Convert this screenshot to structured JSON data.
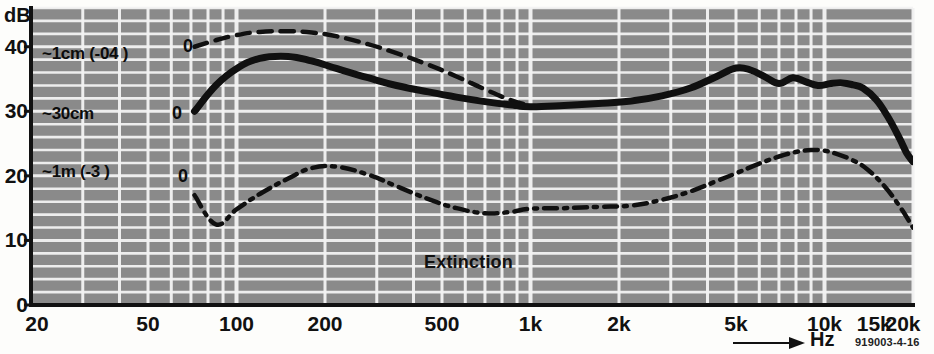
{
  "figure": {
    "reference_code": "919003-4-16",
    "plot_background": "#8a8a8a",
    "grid_color": "#f2f2f2",
    "curve_color": "#101010",
    "axis_color": "#111111"
  },
  "axes": {
    "y_axis_title": "dB",
    "y_ticks": [
      "40",
      "30",
      "20",
      "10",
      "0"
    ],
    "y_values": [
      40,
      30,
      20,
      10,
      0
    ],
    "x_axis_title": "Hz",
    "x_ticks": [
      "20",
      "50",
      "100",
      "200",
      "500",
      "1k",
      "2k",
      "5k",
      "10k",
      "15k",
      "20k"
    ],
    "x_values": [
      20,
      50,
      100,
      200,
      500,
      1000,
      2000,
      5000,
      10000,
      15000,
      20000
    ]
  },
  "annotations": {
    "extinction": "Extinction",
    "curve_1_label": "~1cm (-04 )",
    "curve_2_label": "~30cm",
    "curve_3_label": "~1m (-3 )",
    "zero_marker_1": "0",
    "zero_marker_2": "0",
    "zero_marker_3": "0"
  },
  "chart_data": {
    "type": "line",
    "title": "",
    "subtitle": "",
    "xlabel": "Hz",
    "ylabel": "dB",
    "xscale": "log",
    "xlim": [
      20,
      20000
    ],
    "ylim": [
      0,
      46
    ],
    "grid": true,
    "legend_position": "inline-left",
    "annotations": [
      "Extinction",
      "919003-4-16"
    ],
    "x_tick_labels": [
      "20",
      "50",
      "100",
      "200",
      "500",
      "1k",
      "2k",
      "5k",
      "10k",
      "15k",
      "20k"
    ],
    "y_tick_labels": [
      "0",
      "10",
      "20",
      "30",
      "40"
    ],
    "series": [
      {
        "name": "~1cm (-04 )",
        "style": "dashed",
        "start_marker": "0",
        "x": [
          72,
          85,
          100,
          120,
          150,
          180,
          220,
          280,
          350,
          450,
          560,
          700,
          850,
          1000
        ],
        "y": [
          40.0,
          41.0,
          41.8,
          42.3,
          42.4,
          42.2,
          41.6,
          40.4,
          39.0,
          37.2,
          35.4,
          33.4,
          31.8,
          30.8
        ]
      },
      {
        "name": "~30cm",
        "style": "solid",
        "start_marker": "0",
        "x": [
          72,
          85,
          100,
          120,
          150,
          180,
          220,
          280,
          350,
          450,
          560,
          700,
          850,
          1000,
          1300,
          1700,
          2200,
          2800,
          3500,
          4300,
          5000,
          5600,
          6300,
          7000,
          7800,
          8600,
          9500,
          10500,
          11500,
          12500,
          13500,
          15000,
          16500,
          18000,
          19000,
          20000
        ],
        "y": [
          30.0,
          34.0,
          36.6,
          38.2,
          38.5,
          37.8,
          36.6,
          35.2,
          34.0,
          33.0,
          32.2,
          31.5,
          31.0,
          30.7,
          30.9,
          31.2,
          31.6,
          32.4,
          33.6,
          35.4,
          36.7,
          36.4,
          35.3,
          34.3,
          35.2,
          34.6,
          34.0,
          34.3,
          34.4,
          34.1,
          33.6,
          31.8,
          29.0,
          25.8,
          23.6,
          22.2
        ]
      },
      {
        "name": "~1m (-3 )",
        "style": "dash-dot",
        "start_marker": "0",
        "x": [
          72,
          85,
          100,
          120,
          150,
          180,
          220,
          280,
          350,
          450,
          560,
          700,
          850,
          1000,
          1300,
          1700,
          2200,
          2800,
          3500,
          4300,
          5000,
          6000,
          7000,
          8000,
          9000,
          10000,
          11000,
          12500,
          14000,
          16000,
          18000,
          20000
        ],
        "y": [
          17.0,
          12.5,
          14.8,
          17.2,
          19.6,
          21.2,
          21.4,
          20.2,
          18.4,
          16.4,
          15.0,
          14.2,
          14.4,
          14.9,
          15.0,
          15.2,
          15.4,
          16.3,
          17.6,
          19.2,
          20.4,
          21.9,
          23.0,
          23.7,
          24.0,
          23.9,
          23.4,
          22.4,
          21.0,
          18.4,
          15.3,
          12.0
        ]
      }
    ]
  }
}
